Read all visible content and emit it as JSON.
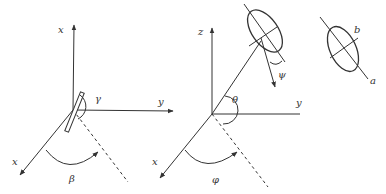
{
  "panel1": {
    "axis_top_label": "x",
    "axis_right_label": "y",
    "axis_diag_label": "x",
    "angle_upper_label": "γ",
    "angle_lower_label": "β"
  },
  "panel2": {
    "axis_top_label": "z",
    "axis_right_label": "y",
    "axis_diag_label": "x",
    "angle_theta_label": "θ",
    "angle_phi_label": "φ",
    "angle_psi_label": "ψ"
  },
  "panel3": {
    "minor_axis_label": "b",
    "major_axis_label": "a"
  },
  "colors": {
    "stroke": "#333333",
    "background": "#ffffff"
  }
}
